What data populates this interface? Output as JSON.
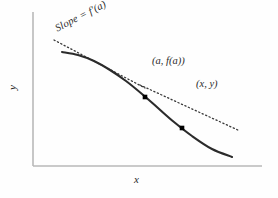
{
  "figure": {
    "background_color": "#fefefe",
    "width": 278,
    "height": 198
  },
  "axes": {
    "x_label": "x",
    "y_label": "y",
    "color": "#b9b9b9",
    "origin": {
      "x": 33,
      "y": 166
    },
    "x_end": {
      "x": 262,
      "y": 166
    },
    "y_top": {
      "x": 33,
      "y": 12
    }
  },
  "annotations": {
    "slope_label": "Slope = f'(a)",
    "point_a_label": "(a, f(a))",
    "point_x_label": "(x, y)"
  },
  "chart_data": {
    "type": "line",
    "title": "",
    "xlabel": "x",
    "ylabel": "y",
    "grid": false,
    "legend": "none",
    "curve_color": "#2b2b2b",
    "line_color": "#3a3a3a",
    "marker_color": "#000000",
    "series": [
      {
        "name": "curve f(x)",
        "style": "solid",
        "points": [
          [
            62,
            52
          ],
          [
            78,
            55
          ],
          [
            94,
            61
          ],
          [
            110,
            70
          ],
          [
            126,
            81
          ],
          [
            142,
            94
          ],
          [
            158,
            108
          ],
          [
            174,
            122
          ],
          [
            192,
            136
          ],
          [
            212,
            149
          ],
          [
            232,
            157
          ]
        ]
      },
      {
        "name": "tangent at a, slope = f'(a)",
        "style": "dotted",
        "points": [
          [
            54,
            40
          ],
          [
            145,
            88
          ]
        ]
      },
      {
        "name": "secant through (a,f(a)) and (x,y)",
        "style": "dotted",
        "points": [
          [
            140,
            85
          ],
          [
            240,
            131
          ]
        ]
      }
    ],
    "markers": [
      {
        "label": "(a, f(a))",
        "x": 145,
        "y": 97,
        "shape": "square"
      },
      {
        "label": "(x, y)",
        "x": 182,
        "y": 128,
        "shape": "square"
      }
    ]
  }
}
